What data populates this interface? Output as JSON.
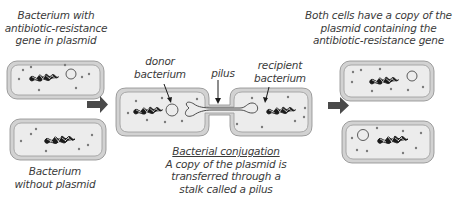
{
  "labels": {
    "top_left": [
      "Bacterium with",
      "antibiotic-resistance",
      "gene in plasmid"
    ],
    "bottom_left": [
      "Bacterium",
      "without plasmid"
    ],
    "donor": [
      "donor",
      "bacterium"
    ],
    "pilus": "pilus",
    "recipient": [
      "recipient",
      "bacterium"
    ],
    "top_right": [
      "Both cells have a copy of the",
      "plasmid containing the",
      "antibiotic-resistance gene"
    ],
    "caption_title": "Bacterial conjugation",
    "caption_body": [
      "A copy of the plasmid is",
      "transferred through a",
      "stalk called a pilus"
    ]
  },
  "icons": {
    "arrow_left": "right-arrow",
    "arrow_right": "right-arrow"
  },
  "colors": {
    "cell_fill": "#ececec",
    "cell_outer": "#d2d2d2",
    "cell_stroke": "#8a8a8a",
    "dot": "#7a7a7a",
    "dna": "#1a1a1a",
    "arrow": "#4a4a4a",
    "text": "#3a3a3a"
  }
}
